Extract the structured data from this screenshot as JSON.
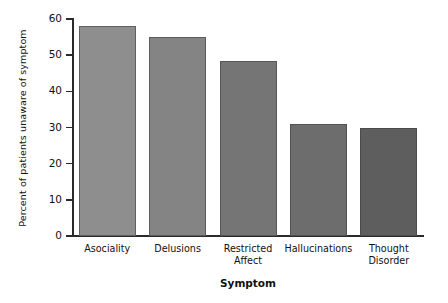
{
  "chart_data": {
    "type": "bar",
    "title": "",
    "xlabel": "Symptom",
    "ylabel": "Percent of patients unaware of symptom",
    "categories": [
      "Asociality",
      "Delusions",
      "Restricted Affect",
      "Hallucinations",
      "Thought Disorder"
    ],
    "category_lines": [
      [
        "Asociality"
      ],
      [
        "Delusions"
      ],
      [
        "Restricted",
        "Affect"
      ],
      [
        "Hallucinations"
      ],
      [
        "Thought",
        "Disorder"
      ]
    ],
    "values": [
      58,
      55,
      48.5,
      31,
      30
    ],
    "bar_colors": [
      "#8e8e8e",
      "#848484",
      "#757575",
      "#6d6d6d",
      "#5e5e5e"
    ],
    "ylim": [
      0,
      60
    ],
    "yticks": [
      0,
      10,
      20,
      30,
      40,
      50,
      60
    ],
    "ytick_labels": [
      "0",
      "10",
      "20",
      "30",
      "40",
      "50",
      "60"
    ],
    "grid": false,
    "legend": false,
    "background": "#ffffff",
    "axis_color": "#2b2b2b"
  }
}
